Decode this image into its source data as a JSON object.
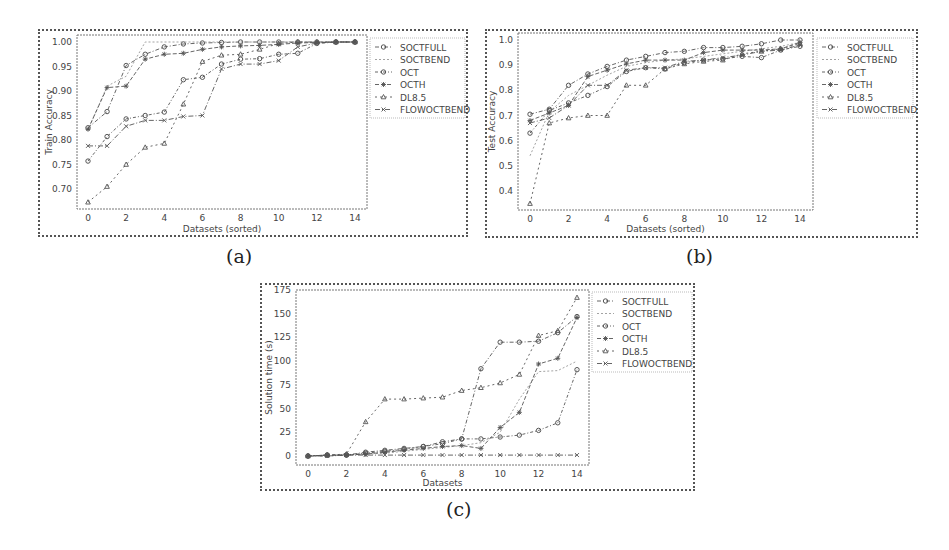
{
  "legend_labels": [
    "SOCTFULL",
    "SOCTBEND",
    "OCT",
    "OCTH",
    "DL8.5",
    "FLOWOCTBEND"
  ],
  "captions": {
    "a": "(a)",
    "b": "(b)",
    "c": "(c)"
  },
  "chart_data": [
    {
      "id": "a",
      "type": "line",
      "title": "",
      "xlabel": "Datasets (sorted)",
      "ylabel": "Train Accuracy",
      "x": [
        0,
        1,
        2,
        3,
        4,
        5,
        6,
        7,
        8,
        9,
        10,
        11,
        12,
        13,
        14
      ],
      "xticks": [
        0,
        2,
        4,
        6,
        8,
        10,
        12,
        14
      ],
      "yticks": [
        "0.70",
        "0.75",
        "0.80",
        "0.85",
        "0.90",
        "0.95",
        "1.00"
      ],
      "ylim": [
        0.66,
        1.01
      ],
      "grid": false,
      "legend_position": "outside right",
      "series": [
        {
          "name": "SOCTFULL",
          "marker": "circle",
          "values": [
            0.825,
            0.858,
            0.952,
            0.975,
            0.99,
            0.996,
            0.998,
            0.999,
            1.0,
            1.0,
            1.0,
            1.0,
            1.0,
            1.0,
            1.0
          ]
        },
        {
          "name": "SOCTBEND",
          "marker": "none",
          "values": [
            0.82,
            0.91,
            0.93,
            1.0,
            1.0,
            1.0,
            1.0,
            1.0,
            1.0,
            1.0,
            1.0,
            1.0,
            1.0,
            1.0,
            1.0
          ]
        },
        {
          "name": "OCT",
          "marker": "circle",
          "values": [
            0.757,
            0.807,
            0.843,
            0.85,
            0.857,
            0.923,
            0.928,
            0.955,
            0.965,
            0.966,
            0.975,
            0.977,
            0.997,
            1.0,
            1.0
          ]
        },
        {
          "name": "OCTH",
          "marker": "star",
          "values": [
            0.822,
            0.907,
            0.91,
            0.965,
            0.975,
            0.977,
            0.985,
            0.99,
            0.992,
            0.993,
            0.995,
            0.998,
            0.999,
            1.0,
            1.0
          ]
        },
        {
          "name": "DL8.5",
          "marker": "triangle",
          "values": [
            0.673,
            0.705,
            0.75,
            0.785,
            0.793,
            0.873,
            0.96,
            0.973,
            0.975,
            0.985,
            0.997,
            1.0,
            1.0,
            1.0,
            1.0
          ]
        },
        {
          "name": "FLOWOCTBEND",
          "marker": "x",
          "values": [
            0.788,
            0.788,
            0.828,
            0.84,
            0.84,
            0.848,
            0.85,
            0.945,
            0.955,
            0.955,
            0.962,
            0.99,
            0.998,
            1.0,
            1.0
          ]
        }
      ]
    },
    {
      "id": "b",
      "type": "line",
      "title": "",
      "xlabel": "Datasets (sorted)",
      "ylabel": "Test Accuracy",
      "x": [
        0,
        1,
        2,
        3,
        4,
        5,
        6,
        7,
        8,
        9,
        10,
        11,
        12,
        13,
        14
      ],
      "xticks": [
        0,
        2,
        4,
        6,
        8,
        10,
        12,
        14
      ],
      "yticks": [
        "0.4",
        "0.5",
        "0.6",
        "0.7",
        "0.8",
        "0.9",
        "1.0"
      ],
      "ylim": [
        0.33,
        1.02
      ],
      "grid": false,
      "legend_position": "outside right",
      "series": [
        {
          "name": "SOCTFULL",
          "marker": "circle",
          "values": [
            0.705,
            0.725,
            0.82,
            0.865,
            0.895,
            0.92,
            0.935,
            0.95,
            0.955,
            0.97,
            0.97,
            0.975,
            0.985,
            1.0,
            1.0
          ]
        },
        {
          "name": "SOCTBEND",
          "marker": "none",
          "values": [
            0.54,
            0.715,
            0.78,
            0.82,
            0.86,
            0.895,
            0.91,
            0.92,
            0.925,
            0.935,
            0.945,
            0.955,
            0.965,
            0.975,
            0.99
          ]
        },
        {
          "name": "OCT",
          "marker": "circle",
          "values": [
            0.63,
            0.72,
            0.75,
            0.78,
            0.815,
            0.875,
            0.89,
            0.885,
            0.91,
            0.92,
            0.925,
            0.935,
            0.93,
            0.96,
            0.975
          ]
        },
        {
          "name": "OCTH",
          "marker": "star",
          "values": [
            0.68,
            0.71,
            0.74,
            0.855,
            0.88,
            0.905,
            0.92,
            0.92,
            0.92,
            0.95,
            0.96,
            0.96,
            0.96,
            0.965,
            0.99
          ]
        },
        {
          "name": "DL8.5",
          "marker": "triangle",
          "values": [
            0.35,
            0.67,
            0.69,
            0.7,
            0.7,
            0.82,
            0.82,
            0.885,
            0.905,
            0.915,
            0.92,
            0.945,
            0.955,
            0.965,
            0.985
          ]
        },
        {
          "name": "FLOWOCTBEND",
          "marker": "x",
          "values": [
            0.67,
            0.69,
            0.74,
            0.82,
            0.82,
            0.88,
            0.89,
            0.89,
            0.915,
            0.92,
            0.93,
            0.94,
            0.955,
            0.96,
            0.98
          ]
        }
      ]
    },
    {
      "id": "c",
      "type": "line",
      "title": "",
      "xlabel": "Datasets",
      "ylabel": "Solution time (s)",
      "x": [
        0,
        1,
        2,
        3,
        4,
        5,
        6,
        7,
        8,
        9,
        10,
        11,
        12,
        13,
        14
      ],
      "xticks": [
        0,
        2,
        4,
        6,
        8,
        10,
        12,
        14
      ],
      "yticks": [
        "0",
        "25",
        "50",
        "75",
        "100",
        "125",
        "150",
        "175"
      ],
      "ylim": [
        -8,
        175
      ],
      "grid": false,
      "legend_position": "outside right",
      "series": [
        {
          "name": "SOCTFULL",
          "marker": "circle",
          "values": [
            0,
            1,
            1,
            4,
            6,
            8,
            10,
            15,
            18,
            92,
            120,
            120,
            121,
            130,
            147
          ]
        },
        {
          "name": "SOCTBEND",
          "marker": "none",
          "values": [
            0,
            0,
            1,
            2,
            3,
            5,
            7,
            9,
            11,
            14,
            25,
            60,
            89,
            90,
            100
          ]
        },
        {
          "name": "OCT",
          "marker": "circle",
          "values": [
            0,
            1,
            1,
            3,
            5,
            7,
            10,
            13,
            18,
            18,
            20,
            22,
            27,
            35,
            91
          ]
        },
        {
          "name": "OCTH",
          "marker": "star",
          "values": [
            0,
            1,
            1,
            2,
            4,
            6,
            8,
            10,
            11,
            8,
            30,
            46,
            97,
            103,
            146
          ]
        },
        {
          "name": "DL8.5",
          "marker": "triangle",
          "values": [
            0,
            1,
            2,
            36,
            60,
            60,
            61,
            62,
            69,
            72,
            77,
            86,
            127,
            132,
            167
          ]
        },
        {
          "name": "FLOWOCTBEND",
          "marker": "x",
          "values": [
            0,
            0,
            1,
            1,
            1,
            1,
            1,
            1,
            1,
            1,
            1,
            1,
            1,
            1,
            1
          ]
        }
      ]
    }
  ],
  "colors": {
    "line": "#555555",
    "frame": "#555555",
    "text": "#444444"
  }
}
